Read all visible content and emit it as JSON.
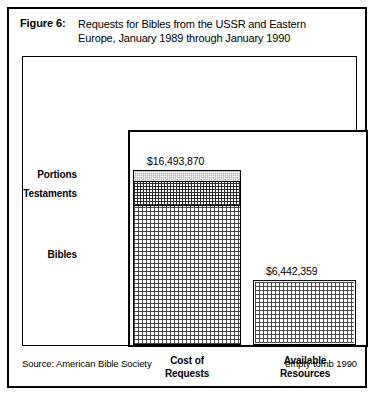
{
  "figure": {
    "label": "Figure 6:",
    "title_line1": "Requests for Bibles from the USSR and Eastern",
    "title_line2": "Europe, January  1989 through January  1990"
  },
  "footer": {
    "source": "Source: American Bible Society",
    "credit": "empty tomb 1990"
  },
  "chart_data": {
    "type": "bar",
    "title": "Figure 6: Requests for Bibles from the USSR and Eastern Europe, January 1989 through January 1990",
    "subtitle": "",
    "xlabel": "",
    "ylabel": "",
    "stacked": true,
    "grid": false,
    "legend_position": "left-axis-labels",
    "ylim": [
      0,
      16493870
    ],
    "currency": "USD",
    "categories": [
      "Cost of Requests",
      "Available Resources"
    ],
    "category_labels": [
      {
        "line1": "Cost of",
        "line2": "Requests"
      },
      {
        "line1": "Available",
        "line2": "Resources"
      }
    ],
    "value_labels": [
      "$16,493,870",
      "$6,442,359"
    ],
    "values": [
      16493870,
      6442359
    ],
    "segment_names": [
      "Portions",
      "Testaments",
      "Bibles"
    ],
    "series": [
      {
        "name": "Portions",
        "values": [
          1130000,
          0
        ],
        "fill": "gray-checker"
      },
      {
        "name": "Testaments",
        "values": [
          2270000,
          0
        ],
        "fill": "dense-crosshatch"
      },
      {
        "name": "Bibles",
        "values": [
          13093870,
          6442359
        ],
        "fill": "dot-grid"
      }
    ],
    "annotations": [
      {
        "text": "$16,493,870",
        "target": "Cost of Requests"
      },
      {
        "text": "$6,442,359",
        "target": "Available Resources"
      }
    ]
  },
  "colors": {
    "ink": "#000000",
    "paper": "#ffffff",
    "portions_fill": "#b9b9b9",
    "testaments_fill": "#2b2b2b",
    "bibles_fill": "#4a4a4a"
  }
}
